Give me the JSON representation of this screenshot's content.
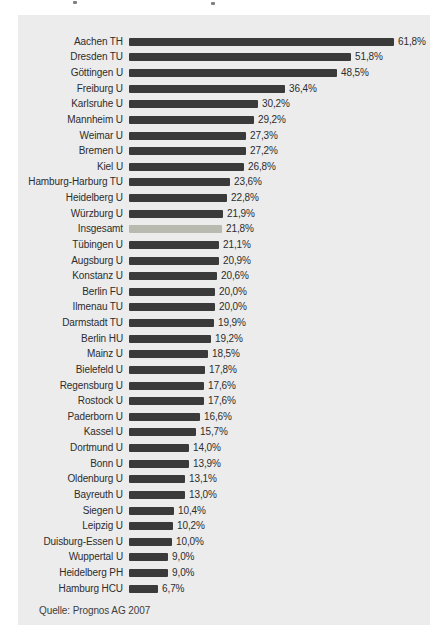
{
  "chart_data": {
    "type": "bar",
    "orientation": "horizontal",
    "title": "",
    "xlabel": "",
    "ylabel": "",
    "unit": "%",
    "xlim": [
      0,
      61.8
    ],
    "grid": false,
    "legend": "none",
    "bar_color": "#3a3a3a",
    "highlight_color": "#b8bab0",
    "panel_background": "#ececec",
    "highlight_category": "Insgesamt",
    "categories": [
      "Aachen TH",
      "Dresden TU",
      "Göttingen U",
      "Freiburg U",
      "Karlsruhe U",
      "Mannheim U",
      "Weimar U",
      "Bremen U",
      "Kiel U",
      "Hamburg-Harburg TU",
      "Heidelberg U",
      "Würzburg U",
      "Insgesamt",
      "Tübingen U",
      "Augsburg U",
      "Konstanz U",
      "Berlin FU",
      "Ilmenau TU",
      "Darmstadt TU",
      "Berlin HU",
      "Mainz U",
      "Bielefeld U",
      "Regensburg U",
      "Rostock U",
      "Paderborn U",
      "Kassel U",
      "Dortmund U",
      "Bonn U",
      "Oldenburg U",
      "Bayreuth U",
      "Siegen U",
      "Leipzig U",
      "Duisburg-Essen U",
      "Wuppertal U",
      "Heidelberg PH",
      "Hamburg HCU"
    ],
    "values": [
      61.8,
      51.8,
      48.5,
      36.4,
      30.2,
      29.2,
      27.3,
      27.2,
      26.8,
      23.6,
      22.8,
      21.9,
      21.8,
      21.1,
      20.9,
      20.6,
      20.0,
      20.0,
      19.9,
      19.2,
      18.5,
      17.8,
      17.6,
      17.6,
      16.6,
      15.7,
      14.0,
      13.9,
      13.1,
      13.0,
      10.4,
      10.2,
      10.0,
      9.0,
      9.0,
      6.7
    ],
    "display_values": [
      "61,8%",
      "51,8%",
      "48,5%",
      "36,4%",
      "30,2%",
      "29,2%",
      "27,3%",
      "27,2%",
      "26,8%",
      "23,6%",
      "22,8%",
      "21,9%",
      "21,8%",
      "21,1%",
      "20,9%",
      "20,6%",
      "20,0%",
      "20,0%",
      "19,9%",
      "19,2%",
      "18,5%",
      "17,8%",
      "17,6%",
      "17,6%",
      "16,6%",
      "15,7%",
      "14,0%",
      "13,9%",
      "13,1%",
      "13,0%",
      "10,4%",
      "10,2%",
      "10,0%",
      "9,0%",
      "9,0%",
      "6,7%"
    ],
    "source": "Quelle: Prognos AG 2007"
  }
}
